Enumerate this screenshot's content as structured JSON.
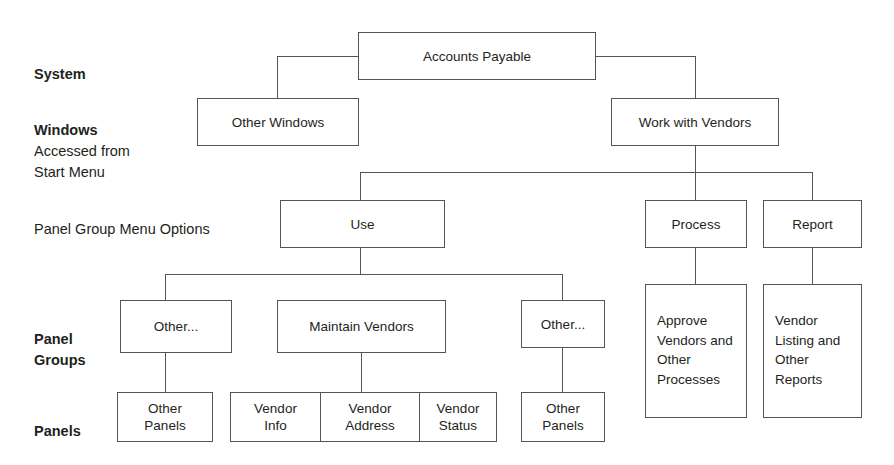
{
  "diagram": {
    "line_color": "#555558",
    "text_color": "#231f20",
    "background": "#ffffff",
    "row_labels": [
      {
        "name": "system",
        "bold_text": "System",
        "sub_text": ""
      },
      {
        "name": "windows",
        "bold_text": "Windows",
        "sub_text": "Accessed from\nStart Menu"
      },
      {
        "name": "panel-group-menu-options",
        "bold_text": "",
        "sub_text": "Panel Group Menu Options"
      },
      {
        "name": "panel-groups",
        "bold_text": "Panel\nGroups",
        "sub_text": ""
      },
      {
        "name": "panels",
        "bold_text": "Panels",
        "sub_text": ""
      }
    ],
    "nodes": {
      "accounts_payable": "Accounts Payable",
      "other_windows": "Other Windows",
      "work_with_vendors": "Work with Vendors",
      "use": "Use",
      "process": "Process",
      "report": "Report",
      "other_left": "Other...",
      "maintain_vendors": "Maintain Vendors",
      "other_right": "Other...",
      "other_panels_left": "Other\nPanels",
      "vendor_info": "Vendor\nInfo",
      "vendor_address": "Vendor\nAddress",
      "vendor_status": "Vendor\nStatus",
      "other_panels_right": "Other\nPanels",
      "approve_vendors": "Approve\nVendors and\nOther\nProcesses",
      "vendor_listing": "Vendor\nListing and\nOther\nReports"
    },
    "levels": [
      "System",
      "Windows Accessed from Start Menu",
      "Panel Group Menu Options",
      "Panel Groups",
      "Panels"
    ]
  }
}
